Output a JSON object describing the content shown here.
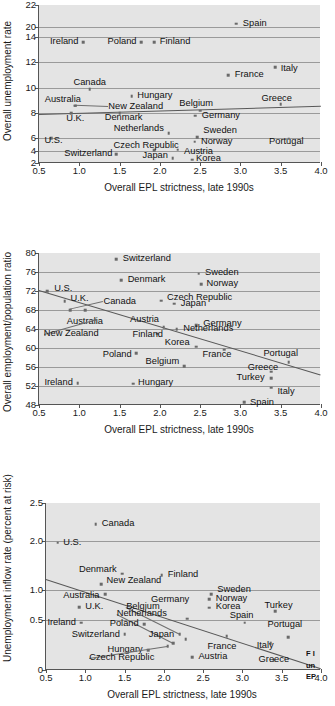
{
  "figure": {
    "caption_fragment_lines": [
      "F I",
      "un",
      "EP"
    ]
  },
  "chart_data": [
    {
      "type": "scatter",
      "title": "",
      "xlabel": "Overall EPL strictness, late 1990s",
      "ylabel": "Overall unemployment rate",
      "xlim": [
        0.5,
        4.0
      ],
      "xticks": [
        0.5,
        1.0,
        1.5,
        2.0,
        2.5,
        3.0,
        3.5,
        4.0
      ],
      "xticklabels": [
        "0.5",
        "1.0",
        "1.5",
        "2.0",
        "2.5",
        "3.0",
        "3.5",
        "4.0"
      ],
      "yticks": [
        22,
        20,
        14,
        12,
        10,
        8,
        6,
        4,
        2
      ],
      "yticklabels": [
        "22",
        "20",
        "14",
        "12",
        "10",
        "8",
        "6",
        "4",
        "2"
      ],
      "y_axis_note": "broken axis between 20 and 14",
      "grid": true,
      "legend": "none",
      "trendline": {
        "x0": 0.5,
        "y0": 7.95,
        "x1": 4.0,
        "y1": 8.6
      },
      "points": [
        {
          "label": "Spain",
          "x": 2.95,
          "y": 20.3,
          "lx": 3.03,
          "ly": 20.3,
          "align": "l"
        },
        {
          "label": "Ireland",
          "x": 1.05,
          "y": 13.6,
          "lx": 0.99,
          "ly": 13.6,
          "align": "r"
        },
        {
          "label": "Poland",
          "x": 1.77,
          "y": 13.6,
          "lx": 1.71,
          "ly": 13.6,
          "align": "r"
        },
        {
          "label": "Finland",
          "x": 1.93,
          "y": 13.6,
          "lx": 2.0,
          "ly": 13.6,
          "align": "l"
        },
        {
          "label": "Italy",
          "x": 3.43,
          "y": 11.6,
          "lx": 3.5,
          "ly": 11.5,
          "align": "l"
        },
        {
          "label": "France",
          "x": 2.85,
          "y": 11.0,
          "lx": 2.93,
          "ly": 11.0,
          "align": "l"
        },
        {
          "label": "Canada",
          "x": 1.13,
          "y": 9.9,
          "lx": 1.13,
          "ly": 10.4,
          "align": "c"
        },
        {
          "label": "Hungary",
          "x": 1.65,
          "y": 9.35,
          "lx": 1.72,
          "ly": 9.35,
          "align": "l"
        },
        {
          "label": "Greece",
          "x": 3.5,
          "y": 8.7,
          "lx": 3.45,
          "ly": 9.1,
          "align": "c"
        },
        {
          "label": "Australia",
          "x": 0.95,
          "y": 8.6,
          "lx": 1.02,
          "ly": 9.05,
          "align": "r"
        },
        {
          "label": "Belgium",
          "x": 2.5,
          "y": 8.2,
          "lx": 2.45,
          "ly": 8.75,
          "align": "c"
        },
        {
          "label": "New Zealand",
          "x": 0.95,
          "y": 8.6,
          "lx": 1.36,
          "ly": 8.5,
          "align": "l"
        },
        {
          "label": "Denmark",
          "x": 1.5,
          "y": 8.0,
          "lx": 1.55,
          "ly": 7.6,
          "align": "c"
        },
        {
          "label": "U.K.",
          "x": 0.9,
          "y": 8.0,
          "lx": 0.95,
          "ly": 7.55,
          "align": "c"
        },
        {
          "label": "Germany",
          "x": 2.44,
          "y": 7.8,
          "lx": 2.52,
          "ly": 7.75,
          "align": "l"
        },
        {
          "label": "Netherlands",
          "x": 2.11,
          "y": 6.4,
          "lx": 2.05,
          "ly": 6.7,
          "align": "r"
        },
        {
          "label": "Sweden",
          "x": 2.46,
          "y": 6.05,
          "lx": 2.54,
          "ly": 6.6,
          "align": "l"
        },
        {
          "label": "U.S.",
          "x": 0.65,
          "y": 6.0,
          "lx": 0.68,
          "ly": 5.5,
          "align": "c"
        },
        {
          "label": "Portugal",
          "x": 3.6,
          "y": 5.9,
          "lx": 3.57,
          "ly": 5.4,
          "align": "c"
        },
        {
          "label": "Norway",
          "x": 2.43,
          "y": 5.4,
          "lx": 2.51,
          "ly": 5.4,
          "align": "l"
        },
        {
          "label": "Czech Republic",
          "x": 1.93,
          "y": 4.05,
          "lx": 1.83,
          "ly": 4.75,
          "align": "c"
        },
        {
          "label": "Austria",
          "x": 2.22,
          "y": 4.1,
          "lx": 2.3,
          "ly": 3.75,
          "align": "l"
        },
        {
          "label": "Switzerland",
          "x": 1.46,
          "y": 3.4,
          "lx": 1.41,
          "ly": 3.4,
          "align": "r"
        },
        {
          "label": "Japan",
          "x": 2.16,
          "y": 2.8,
          "lx": 2.1,
          "ly": 3.15,
          "align": "r"
        },
        {
          "label": "Korea",
          "x": 2.4,
          "y": 2.5,
          "lx": 2.45,
          "ly": 2.65,
          "align": "l"
        }
      ]
    },
    {
      "type": "scatter",
      "title": "",
      "xlabel": "Overall EPL strictness, late 1990s",
      "ylabel": "Overall employment/population ratio",
      "xlim": [
        0.5,
        4.0
      ],
      "xticks": [
        0.5,
        1.0,
        1.5,
        2.0,
        2.5,
        3.0,
        3.5,
        4.0
      ],
      "xticklabels": [
        "0.5",
        "1.0",
        "1.5",
        "2.0",
        "2.5",
        "3.0",
        "3.5",
        "4.0"
      ],
      "ylim": [
        48,
        80
      ],
      "yticks": [
        80,
        76,
        72,
        68,
        64,
        60,
        56,
        52,
        48
      ],
      "yticklabels": [
        "80",
        "76",
        "72",
        "68",
        "64",
        "60",
        "56",
        "52",
        "48"
      ],
      "grid": true,
      "legend": "none",
      "trendline": {
        "x0": 0.5,
        "y0": 72.2,
        "x1": 4.0,
        "y1": 54.4
      },
      "points": [
        {
          "label": "Switzerland",
          "x": 1.46,
          "y": 78.7,
          "lx": 1.54,
          "ly": 78.7,
          "align": "l"
        },
        {
          "label": "Sweden",
          "x": 2.48,
          "y": 75.6,
          "lx": 2.56,
          "ly": 75.8,
          "align": "l"
        },
        {
          "label": "Denmark",
          "x": 1.52,
          "y": 74.3,
          "lx": 1.6,
          "ly": 74.4,
          "align": "l"
        },
        {
          "label": "Norway",
          "x": 2.51,
          "y": 73.4,
          "lx": 2.58,
          "ly": 73.5,
          "align": "l"
        },
        {
          "label": "U.S.",
          "x": 0.6,
          "y": 72.0,
          "lx": 0.69,
          "ly": 72.5,
          "align": "l"
        },
        {
          "label": "Czech Republic",
          "x": 2.02,
          "y": 70.0,
          "lx": 2.09,
          "ly": 70.6,
          "align": "l"
        },
        {
          "label": "U.K.",
          "x": 0.82,
          "y": 69.9,
          "lx": 0.89,
          "ly": 70.4,
          "align": "l"
        },
        {
          "label": "Japan",
          "x": 2.18,
          "y": 69.3,
          "lx": 2.26,
          "ly": 69.2,
          "align": "l"
        },
        {
          "label": "Canada",
          "x": 0.89,
          "y": 68.0,
          "lx": 1.3,
          "ly": 69.6,
          "align": "l"
        },
        {
          "label": "Australia",
          "x": 1.07,
          "y": 68.0,
          "lx": 1.07,
          "ly": 65.4,
          "align": "c"
        },
        {
          "label": "Austria",
          "x": 2.05,
          "y": 64.4,
          "lx": 1.99,
          "ly": 65.8,
          "align": "r"
        },
        {
          "label": "Germany",
          "x": 2.45,
          "y": 64.8,
          "lx": 2.54,
          "ly": 65.0,
          "align": "l"
        },
        {
          "label": "Netherlands",
          "x": 2.21,
          "y": 64.0,
          "lx": 2.29,
          "ly": 64.0,
          "align": "l"
        },
        {
          "label": "New Zealand",
          "x": 1.2,
          "y": 66.0,
          "lx": 0.56,
          "ly": 62.9,
          "align": "l"
        },
        {
          "label": "Finland",
          "x": 1.97,
          "y": 63.0,
          "lx": 1.85,
          "ly": 62.8,
          "align": "c"
        },
        {
          "label": "Korea",
          "x": 2.45,
          "y": 60.3,
          "lx": 2.37,
          "ly": 61.0,
          "align": "r"
        },
        {
          "label": "Poland",
          "x": 1.71,
          "y": 58.9,
          "lx": 1.65,
          "ly": 58.6,
          "align": "r"
        },
        {
          "label": "France",
          "x": 2.8,
          "y": 59.6,
          "lx": 2.71,
          "ly": 58.6,
          "align": "c"
        },
        {
          "label": "Portugal",
          "x": 3.6,
          "y": 57.0,
          "lx": 3.5,
          "ly": 58.8,
          "align": "c"
        },
        {
          "label": "Belgium",
          "x": 2.3,
          "y": 56.2,
          "lx": 2.24,
          "ly": 57.1,
          "align": "r"
        },
        {
          "label": "Greece",
          "x": 3.38,
          "y": 55.0,
          "lx": 3.28,
          "ly": 55.7,
          "align": "c"
        },
        {
          "label": "Turkey",
          "x": 3.38,
          "y": 53.7,
          "lx": 3.3,
          "ly": 53.7,
          "align": "r"
        },
        {
          "label": "Ireland",
          "x": 0.98,
          "y": 52.6,
          "lx": 0.92,
          "ly": 52.6,
          "align": "r"
        },
        {
          "label": "Hungary",
          "x": 1.67,
          "y": 52.5,
          "lx": 1.73,
          "ly": 52.6,
          "align": "l"
        },
        {
          "label": "Italy",
          "x": 3.38,
          "y": 51.6,
          "lx": 3.46,
          "ly": 50.8,
          "align": "l"
        },
        {
          "label": "Spain",
          "x": 3.05,
          "y": 48.6,
          "lx": 3.12,
          "ly": 48.5,
          "align": "l"
        }
      ]
    },
    {
      "type": "scatter",
      "title": "",
      "xlabel": "Overall EPL strictness, late 1990s",
      "ylabel": "Unemployment inflow rate (percent at risk)",
      "xlim": [
        0.5,
        4.0
      ],
      "xticks": [
        0.5,
        1.0,
        1.5,
        2.0,
        2.5,
        3.0,
        3.5,
        4.0
      ],
      "xticklabels": [
        "0.5",
        "1.0",
        "1.5",
        "2.0",
        "2.5",
        "3.0",
        "3.5",
        "4.0"
      ],
      "yticks": [
        2.5,
        2.0,
        1.0,
        0.5,
        0
      ],
      "yticklabels": [
        "2.5",
        "2.0",
        "1.0",
        "0.5",
        "0"
      ],
      "grid": true,
      "legend": "none",
      "trendline": {
        "x0": 0.5,
        "y0": 1.23,
        "x1": 4.0,
        "y1": 0.02
      },
      "points": [
        {
          "label": "Canada",
          "x": 1.13,
          "y": 2.22,
          "lx": 1.21,
          "ly": 2.22,
          "align": "l"
        },
        {
          "label": "U.S.",
          "x": 0.65,
          "y": 1.97,
          "lx": 0.72,
          "ly": 1.97,
          "align": "l"
        },
        {
          "label": "Denmark",
          "x": 1.47,
          "y": 1.33,
          "lx": 1.4,
          "ly": 1.4,
          "align": "r"
        },
        {
          "label": "Finland",
          "x": 1.97,
          "y": 1.3,
          "lx": 2.05,
          "ly": 1.31,
          "align": "l"
        },
        {
          "label": "New Zealand",
          "x": 1.2,
          "y": 1.12,
          "lx": 1.27,
          "ly": 1.18,
          "align": "l"
        },
        {
          "label": "Sweden",
          "x": 2.6,
          "y": 0.93,
          "lx": 2.68,
          "ly": 1.0,
          "align": "l"
        },
        {
          "label": "Australia",
          "x": 1.25,
          "y": 0.93,
          "lx": 1.18,
          "ly": 0.9,
          "align": "r"
        },
        {
          "label": "Norway",
          "x": 2.58,
          "y": 0.84,
          "lx": 2.66,
          "ly": 0.85,
          "align": "l"
        },
        {
          "label": "Germany",
          "x": 2.3,
          "y": 0.52,
          "lx": 2.08,
          "ly": 0.83,
          "align": "c"
        },
        {
          "label": "U.K.",
          "x": 0.92,
          "y": 0.71,
          "lx": 1.0,
          "ly": 0.72,
          "align": "l"
        },
        {
          "label": "Korea",
          "x": 2.58,
          "y": 0.7,
          "lx": 2.66,
          "ly": 0.71,
          "align": "l"
        },
        {
          "label": "Turkey",
          "x": 3.42,
          "y": 0.64,
          "lx": 3.46,
          "ly": 0.73,
          "align": "c"
        },
        {
          "label": "Belgium",
          "x": 2.2,
          "y": 0.36,
          "lx": 1.52,
          "ly": 0.71,
          "align": "l"
        },
        {
          "label": "Netherlands",
          "x": 2.12,
          "y": 0.27,
          "lx": 1.4,
          "ly": 0.6,
          "align": "l"
        },
        {
          "label": "Spain",
          "x": 3.03,
          "y": 0.47,
          "lx": 2.99,
          "ly": 0.57,
          "align": "c"
        },
        {
          "label": "Ireland",
          "x": 0.95,
          "y": 0.47,
          "lx": 0.88,
          "ly": 0.47,
          "align": "r"
        },
        {
          "label": "Poland",
          "x": 1.75,
          "y": 0.46,
          "lx": 1.68,
          "ly": 0.46,
          "align": "r"
        },
        {
          "label": "Portugal",
          "x": 3.58,
          "y": 0.33,
          "lx": 3.54,
          "ly": 0.45,
          "align": "c"
        },
        {
          "label": "Switzerland",
          "x": 1.5,
          "y": 0.36,
          "lx": 1.44,
          "ly": 0.35,
          "align": "r"
        },
        {
          "label": "Japan",
          "x": 2.28,
          "y": 0.31,
          "lx": 1.97,
          "ly": 0.35,
          "align": "c"
        },
        {
          "label": "France",
          "x": 2.8,
          "y": 0.34,
          "lx": 2.74,
          "ly": 0.23,
          "align": "c"
        },
        {
          "label": "Italy",
          "x": 3.36,
          "y": 0.27,
          "lx": 3.29,
          "ly": 0.24,
          "align": "c"
        },
        {
          "label": "Hungary",
          "x": 1.8,
          "y": 0.2,
          "lx": 1.73,
          "ly": 0.2,
          "align": "r"
        },
        {
          "label": "Austria",
          "x": 2.36,
          "y": 0.13,
          "lx": 2.44,
          "ly": 0.13,
          "align": "l"
        },
        {
          "label": "Greece",
          "x": 3.4,
          "y": 0.1,
          "lx": 3.4,
          "ly": 0.1,
          "align": "c"
        },
        {
          "label": "Czech Republic",
          "x": 2.05,
          "y": 0.24,
          "lx": 1.05,
          "ly": 0.12,
          "align": "l"
        }
      ]
    }
  ]
}
